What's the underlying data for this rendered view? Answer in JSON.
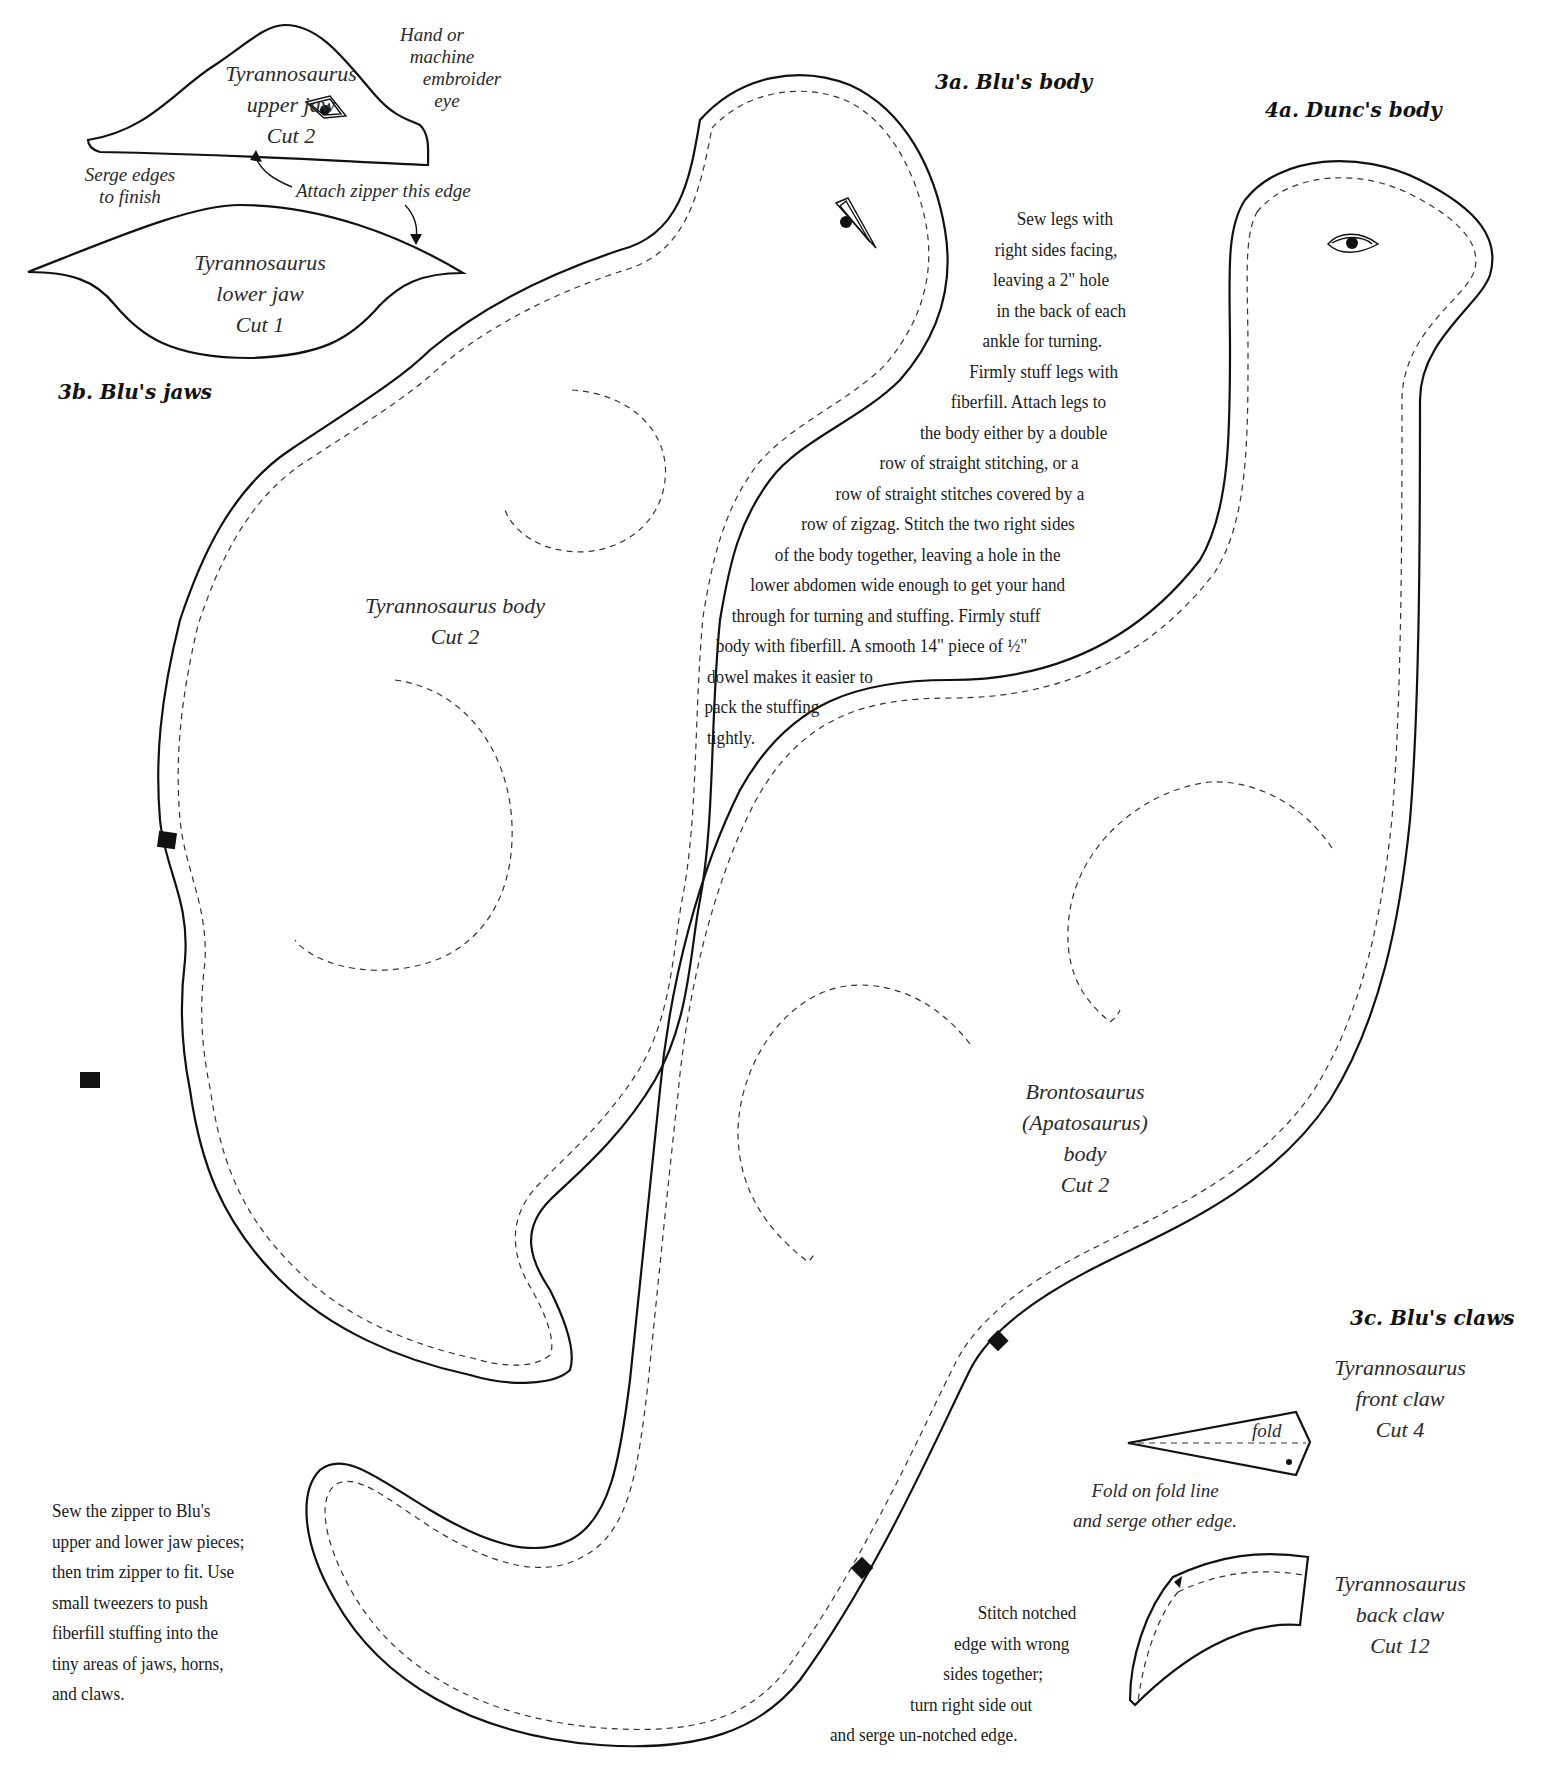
{
  "sections": {
    "blu_jaws": {
      "heading": "3b. Blu's jaws",
      "upper_jaw": {
        "name": "Tyrannosaurus",
        "part": "upper jaw",
        "cut": "Cut 2"
      },
      "lower_jaw": {
        "name": "Tyrannosaurus",
        "part": "lower jaw",
        "cut": "Cut 1"
      },
      "eye_note": [
        "Hand or",
        "machine",
        "embroider",
        "eye"
      ],
      "serge_note": [
        "Serge edges",
        "to finish"
      ],
      "zipper_note": "Attach zipper this edge"
    },
    "blu_body": {
      "heading": "3a. Blu's body",
      "piece_label": "Tyrannosaurus body",
      "cut": "Cut 2"
    },
    "dunc_body": {
      "heading": "4a. Dunc's body",
      "piece_label": [
        "Brontosaurus",
        "(Apatosaurus)",
        "body"
      ],
      "cut": "Cut 2"
    },
    "blu_claws": {
      "heading": "3c. Blu's claws",
      "front_claw": {
        "name": "Tyrannosaurus",
        "part": "front claw",
        "cut": "Cut 4",
        "fold_label": "fold"
      },
      "front_claw_note": [
        "Fold on fold line",
        "and serge other edge."
      ],
      "back_claw": {
        "name": "Tyrannosaurus",
        "part": "back claw",
        "cut": "Cut 12"
      },
      "back_claw_note": [
        "Stitch notched",
        "edge with wrong",
        "sides together;",
        "turn right side out",
        "and serge un-notched edge."
      ]
    }
  },
  "instructions": {
    "legs_body": [
      "Sew legs with",
      "right sides facing,",
      "leaving a 2\" hole",
      "in the back of each",
      "ankle for turning.",
      "Firmly stuff legs with",
      "fiberfill. Attach legs to",
      "the body either by a double",
      "row of straight stitching, or a",
      "row of straight stitches covered by a",
      "row of zigzag. Stitch the two right sides",
      "of the body together, leaving a hole in the",
      "lower abdomen wide enough to get your hand",
      "through for turning and stuffing. Firmly stuff",
      "body with fiberfill. A smooth 14\" piece of ½\"",
      "dowel makes it easier to",
      "pack the stuffing",
      "tightly."
    ],
    "zipper": [
      "Sew the zipper to Blu's",
      "upper and lower jaw pieces;",
      "then trim zipper to fit. Use",
      "small tweezers to push",
      "fiberfill stuffing into the",
      "tiny areas of jaws, horns,",
      "and claws."
    ]
  },
  "style": {
    "line_color": "#111111",
    "background": "#ffffff"
  }
}
